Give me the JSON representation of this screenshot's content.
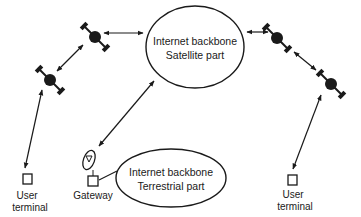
{
  "diagram": {
    "nodes": {
      "backbone_satellite": {
        "line1": "Internet backbone",
        "line2": "Satellite part"
      },
      "backbone_terrestrial": {
        "line1": "Internet backbone",
        "line2": "Terrestrial part"
      },
      "gateway": {
        "label": "Gateway"
      },
      "user_terminal_left": {
        "line1": "User",
        "line2": "terminal"
      },
      "user_terminal_right": {
        "line1": "User",
        "line2": "terminal"
      }
    },
    "satellites": [
      {
        "id": "sat-left-upper"
      },
      {
        "id": "sat-left-lower"
      },
      {
        "id": "sat-right-upper"
      },
      {
        "id": "sat-right-lower"
      }
    ],
    "links": [
      {
        "from": "sat-left-upper",
        "to": "backbone_satellite",
        "type": "bidirectional"
      },
      {
        "from": "sat-left-upper",
        "to": "sat-left-lower",
        "type": "bidirectional"
      },
      {
        "from": "backbone_satellite",
        "to": "sat-right-upper",
        "type": "bidirectional"
      },
      {
        "from": "sat-right-upper",
        "to": "sat-right-lower",
        "type": "bidirectional"
      },
      {
        "from": "sat-left-lower",
        "to": "user_terminal_left",
        "type": "bidirectional"
      },
      {
        "from": "sat-right-lower",
        "to": "user_terminal_right",
        "type": "bidirectional"
      },
      {
        "from": "backbone_satellite",
        "to": "gateway",
        "type": "bidirectional"
      },
      {
        "from": "gateway",
        "to": "backbone_terrestrial",
        "type": "line"
      }
    ],
    "colors": {
      "ink": "#1a1a1a",
      "background": "#ffffff"
    }
  }
}
